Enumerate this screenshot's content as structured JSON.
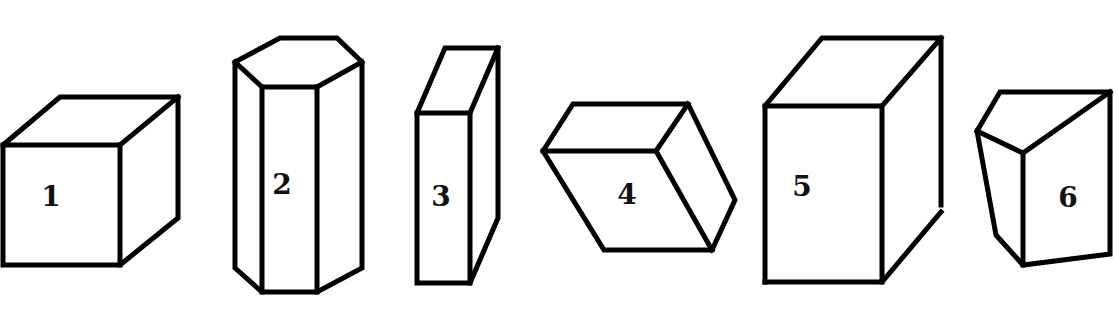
{
  "figure": {
    "line_color": "#000000",
    "background": "#ffffff"
  },
  "shapes": [
    {
      "label": "1",
      "kind": "cube"
    },
    {
      "label": "2",
      "kind": "hexagonal-prism"
    },
    {
      "label": "3",
      "kind": "thin-rectangular-prism"
    },
    {
      "label": "4",
      "kind": "tilted-rhombic-prism"
    },
    {
      "label": "5",
      "kind": "rectangular-prism"
    },
    {
      "label": "6",
      "kind": "truncated-wedge-prism"
    }
  ]
}
